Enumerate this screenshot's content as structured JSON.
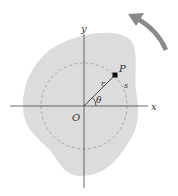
{
  "diagram": {
    "labels": {
      "x_axis": "x",
      "y_axis": "y",
      "origin": "O",
      "point": "P",
      "radius": "r",
      "arc": "s",
      "angle": "θ"
    },
    "colors": {
      "body_fill": "#dcdcdc",
      "axis": "#444444",
      "dashed_circle": "#999999",
      "arrow": "#8a8a8a",
      "point": "#111111"
    },
    "rotation_arrow": "counterclockwise"
  }
}
